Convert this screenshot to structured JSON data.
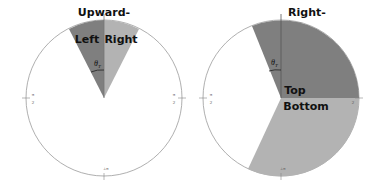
{
  "diagrams": [
    {
      "title": "Upward-",
      "sectors": [
        {
          "label": "Left",
          "color": "#7f7f7f"
        },
        {
          "label": "Right",
          "color": "#b3b3b3"
        }
      ],
      "angle_label": "θ",
      "angle_sub": "T",
      "ticks": {
        "left": "π",
        "left_den": "2",
        "right": "π",
        "right_den": "2",
        "bottom": "±π"
      }
    },
    {
      "title": "Right-",
      "sectors": [
        {
          "label": "Top",
          "color": "#7f7f7f"
        },
        {
          "label": "Bottom",
          "color": "#b3b3b3"
        }
      ],
      "angle_label": "θ",
      "angle_sub": "T",
      "ticks": {
        "left": "π",
        "left_den": "2",
        "right": "2",
        "bottom": "±π"
      }
    }
  ],
  "colors": {
    "dark_sector": "#7f7f7f",
    "light_sector": "#b3b3b3",
    "outline": "#9a9a9a"
  }
}
